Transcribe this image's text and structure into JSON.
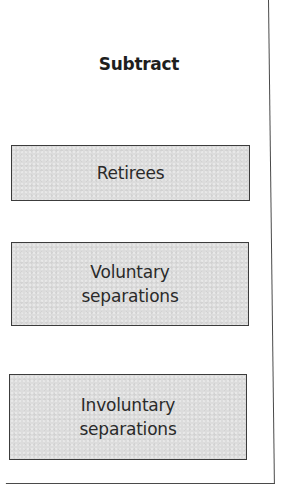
{
  "diagram": {
    "title": "Subtract",
    "boxes": [
      {
        "lines": [
          "Retirees"
        ]
      },
      {
        "lines": [
          "Voluntary",
          "separations"
        ]
      },
      {
        "lines": [
          "Involuntary",
          "separations"
        ]
      }
    ]
  },
  "colors": {
    "box_fill": "#dcdcdc",
    "box_border": "#3c3c3c",
    "frame_border": "#4a4a4a",
    "text": "#2a2a2a",
    "background": "#ffffff"
  }
}
